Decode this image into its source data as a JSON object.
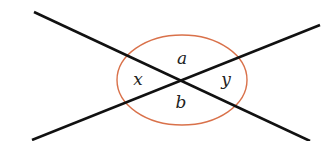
{
  "diagram": {
    "colors": {
      "line": "#111111",
      "arc": "#d9714a",
      "label": "#222222",
      "background": "#ffffff"
    },
    "intersection": {
      "x": 181,
      "y": 81
    },
    "lines": [
      {
        "id": "line-1",
        "x1": 34,
        "y1": 12,
        "x2": 310,
        "y2": 141
      },
      {
        "id": "line-2",
        "x1": 32,
        "y1": 140,
        "x2": 320,
        "y2": 25
      }
    ],
    "arc": {
      "cx": 182,
      "cy": 80,
      "rx": 65,
      "ry": 45
    },
    "labels": {
      "top": {
        "text": "a",
        "x": 182,
        "y": 64
      },
      "bottom": {
        "text": "b",
        "x": 181,
        "y": 108
      },
      "left": {
        "text": "x",
        "x": 138,
        "y": 85
      },
      "right": {
        "text": "y",
        "x": 226,
        "y": 85
      }
    }
  }
}
